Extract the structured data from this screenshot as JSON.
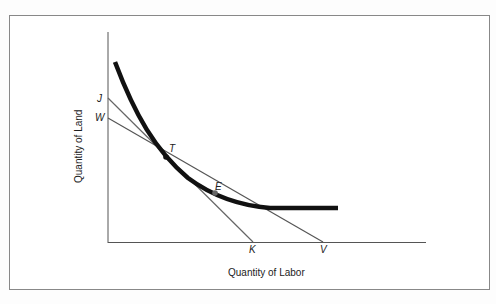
{
  "diagram": {
    "x_axis_label": "Quantity of Labor",
    "y_axis_label": "Quantity of Land",
    "points": {
      "J": "J",
      "W": "W",
      "T": "T",
      "E": "E",
      "K": "K",
      "V": "V"
    },
    "elements": [
      {
        "type": "isoquant",
        "description": "convex curve through T and E"
      },
      {
        "type": "isocost line",
        "from": "J",
        "to": "K",
        "tangent_at": "T"
      },
      {
        "type": "isocost line",
        "from": "W",
        "to": "V",
        "tangent_at": "E"
      }
    ]
  }
}
